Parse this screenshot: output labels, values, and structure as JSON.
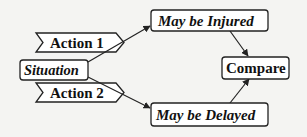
{
  "diagram": {
    "nodes": {
      "situation": "Situation",
      "action1": "Action 1",
      "action2": "Action 2",
      "injured": "May be Injured",
      "delayed": "May be Delayed",
      "compare": "Compare"
    },
    "edges": [
      {
        "from": "Situation",
        "to": "May be Injured",
        "via": "Action 1"
      },
      {
        "from": "Situation",
        "to": "May be Delayed",
        "via": "Action 2"
      },
      {
        "from": "May be Injured",
        "to": "Compare"
      },
      {
        "from": "May be Delayed",
        "to": "Compare"
      }
    ],
    "colors": {
      "stroke": "#222222",
      "fill": "#ffffff",
      "background": "#f4f4f2"
    }
  }
}
